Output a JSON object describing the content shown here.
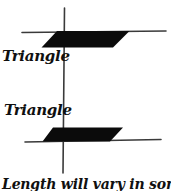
{
  "figure": {
    "label_top": "Triangle",
    "label_bottom": "Triangle",
    "caption": "Length will vary in some.",
    "ink_color": "#0b0b0b",
    "line_color": "#3a3a3a",
    "background": "#ffffff",
    "shapes": [
      "vertical-axis-line",
      "top-horizontal-line",
      "top-filled-parallelogram",
      "bottom-horizontal-line",
      "bottom-filled-parallelogram"
    ]
  }
}
